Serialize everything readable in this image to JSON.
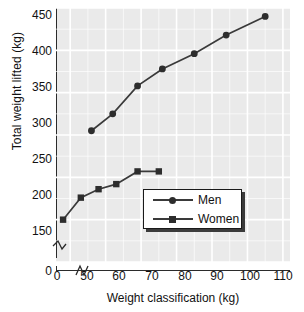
{
  "chart_data": {
    "type": "line",
    "title": "",
    "xlabel": "Weight classification (kg)",
    "ylabel": "Total weight lifted (kg)",
    "xlim": [
      46,
      112
    ],
    "ylim": [
      150,
      450
    ],
    "xticks": [
      0,
      50,
      60,
      70,
      80,
      90,
      100,
      110
    ],
    "yticks": [
      0,
      150,
      200,
      250,
      300,
      350,
      400,
      450
    ],
    "axis_break_x": true,
    "axis_break_y": true,
    "grid": true,
    "legend_position": "inside-lower-right",
    "series": [
      {
        "name": "Men",
        "marker": "circle",
        "x": [
          56,
          62,
          69,
          76,
          85,
          94,
          105
        ],
        "values": [
          305,
          325,
          358,
          378,
          396,
          418,
          440
        ]
      },
      {
        "name": "Women",
        "marker": "square",
        "x": [
          48,
          53,
          58,
          63,
          69,
          75
        ],
        "values": [
          200,
          226,
          236,
          242,
          257,
          257
        ]
      }
    ]
  },
  "axes": {
    "y_tick_labels": [
      "450",
      "400",
      "350",
      "300",
      "250",
      "200",
      "150",
      "0"
    ],
    "x_tick_labels": [
      "0",
      "50",
      "60",
      "70",
      "80",
      "90",
      "100",
      "110"
    ],
    "y_axis_title": "Total weight lifted (kg)",
    "x_axis_title": "Weight classification (kg)"
  },
  "legend": {
    "items": [
      {
        "label": "Men",
        "marker": "circle-marker"
      },
      {
        "label": "Women",
        "marker": "square-marker"
      }
    ]
  },
  "colors": {
    "plot_background": "#eaeaea",
    "grid": "#ffffff",
    "series_line": "#3a3a3a",
    "marker": "#2d2d2d",
    "axis": "#2b2b2b",
    "text": "#111111",
    "legend_shadow": "#3b3b3b"
  }
}
